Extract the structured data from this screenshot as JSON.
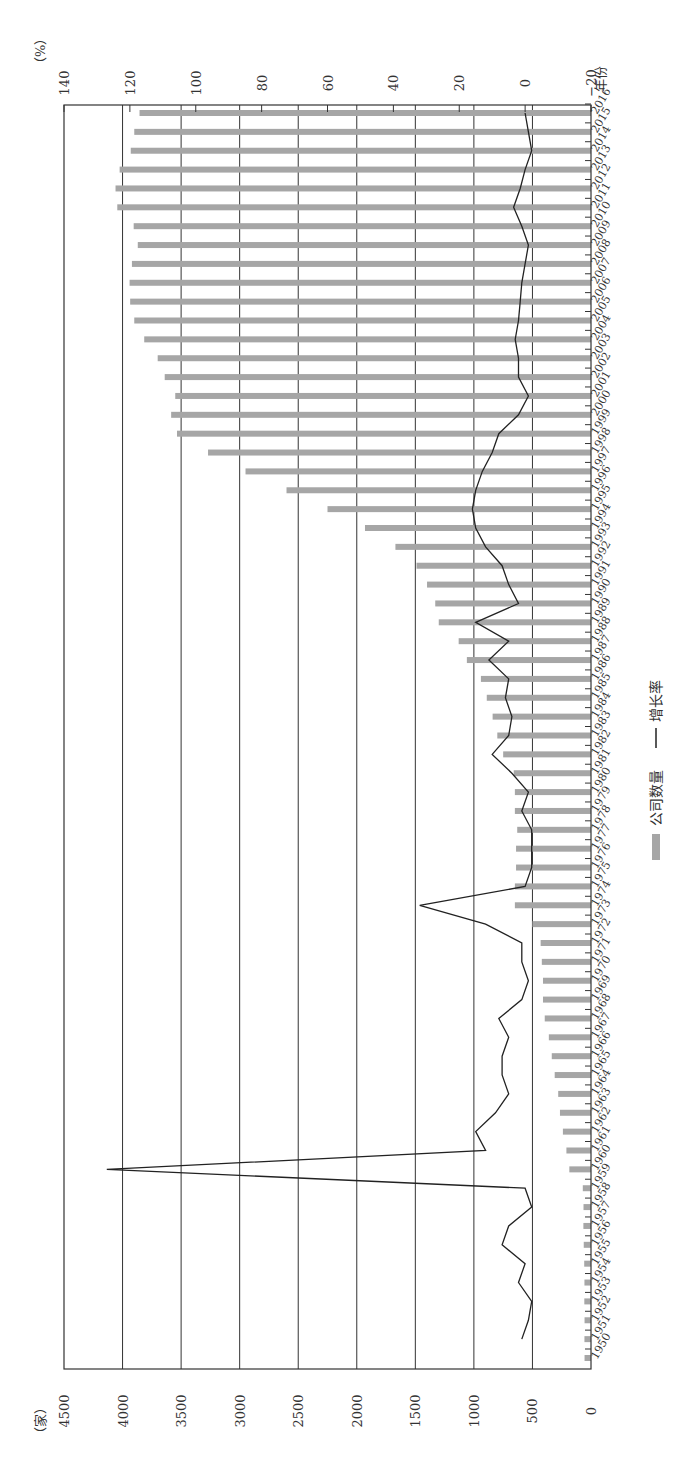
{
  "chart_data": {
    "type": "bar+line",
    "orientation": "rotated-90-clockwise",
    "title": "",
    "xlabel": "年份",
    "ylabel_left": "（家）",
    "ylabel_right": "（%）",
    "left_axis": {
      "label": "（家）",
      "ticks": [
        0,
        500,
        1000,
        1500,
        2000,
        2500,
        3000,
        3500,
        4000,
        4500
      ],
      "range": [
        0,
        4500
      ]
    },
    "right_axis": {
      "label": "（%）",
      "ticks": [
        -20,
        0,
        20,
        40,
        60,
        80,
        100,
        120,
        140
      ],
      "range": [
        -20,
        140
      ]
    },
    "grid": true,
    "legend": {
      "position": "bottom",
      "entries": [
        "公司数量",
        "增长率"
      ]
    },
    "categories": [
      1950,
      1951,
      1952,
      1953,
      1954,
      1955,
      1956,
      1957,
      1958,
      1959,
      1960,
      1961,
      1962,
      1963,
      1964,
      1965,
      1966,
      1967,
      1968,
      1969,
      1970,
      1971,
      1972,
      1973,
      1974,
      1975,
      1976,
      1977,
      1978,
      1979,
      1980,
      1981,
      1982,
      1983,
      1984,
      1985,
      1986,
      1987,
      1988,
      1989,
      1990,
      1991,
      1992,
      1993,
      1994,
      1995,
      1996,
      1997,
      1998,
      1999,
      2000,
      2001,
      2002,
      2003,
      2004,
      2005,
      2006,
      2007,
      2008,
      2009,
      2010,
      2011,
      2012,
      2013,
      2014,
      2015,
      2016
    ],
    "series": [
      {
        "name": "公司数量",
        "type": "bar",
        "axis": "left",
        "color": "#a6a6a6",
        "values": [
          55,
          56,
          55,
          57,
          56,
          58,
          62,
          65,
          64,
          70,
          185,
          210,
          240,
          265,
          280,
          310,
          335,
          360,
          395,
          410,
          410,
          420,
          430,
          500,
          650,
          650,
          640,
          640,
          630,
          650,
          650,
          660,
          750,
          800,
          840,
          890,
          940,
          1060,
          1130,
          1300,
          1330,
          1400,
          1490,
          1670,
          1930,
          2250,
          2600,
          2950,
          3270,
          3535,
          3585,
          3550,
          3640,
          3700,
          3815,
          3900,
          3935,
          3940,
          3920,
          3870,
          3905,
          4045,
          4060,
          4025,
          3930,
          3900,
          3855
        ]
      },
      {
        "name": "增长率",
        "type": "line",
        "axis": "right",
        "color": "#222222",
        "values": [
          null,
          1,
          -1,
          -2,
          2,
          0,
          7,
          5,
          -2,
          0,
          127,
          12,
          15,
          9,
          5,
          7,
          7,
          5,
          8,
          1,
          -1,
          1,
          1,
          12,
          32,
          0,
          -2,
          -2,
          -2,
          1,
          -1,
          4,
          10,
          5,
          4,
          6,
          5,
          11,
          5,
          15,
          2,
          5,
          7,
          12,
          15,
          16,
          15,
          13,
          10,
          8,
          2,
          -1,
          2,
          2,
          3,
          2,
          1.5,
          1,
          0,
          -1,
          1,
          3.5,
          1.5,
          0,
          -2,
          -1,
          0
        ]
      }
    ]
  },
  "labels": {
    "left_unit": "（家）",
    "right_unit": "（%）",
    "x_unit": "年份",
    "legend_bar": "公司数量",
    "legend_line": "增长率"
  },
  "colors": {
    "bar": "#a6a6a6",
    "line": "#222222",
    "grid": "#333333"
  }
}
